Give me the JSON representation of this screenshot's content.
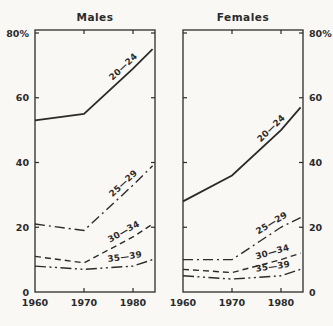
{
  "figure": {
    "background": "#f9f8f5",
    "ink": "#2b2b2b"
  },
  "chart_data": [
    {
      "type": "line",
      "title": "Males",
      "x": [
        1960,
        1970,
        1980,
        1984
      ],
      "x_ticks": [
        1970,
        1980
      ],
      "x_tick_labels": [
        {
          "year": 1960,
          "label": "1960"
        },
        {
          "year": 1970,
          "label": "1970"
        },
        {
          "year": 1980,
          "label": "1980"
        }
      ],
      "ylim": [
        0,
        81
      ],
      "y_axis_side": "left",
      "y_ticks": [
        {
          "value": 80,
          "label": "80%"
        },
        {
          "value": 60,
          "label": "60"
        },
        {
          "value": 40,
          "label": "40"
        },
        {
          "value": 20,
          "label": "20"
        },
        {
          "value": 0,
          "label": "0"
        }
      ],
      "grid": false,
      "legend": "inline-rotated-labels",
      "series": [
        {
          "name": "20—24",
          "style": "solid",
          "values": [
            53,
            55,
            69,
            75
          ]
        },
        {
          "name": "25—29",
          "style": "dash-dot",
          "values": [
            21,
            19,
            33,
            39
          ]
        },
        {
          "name": "30—34",
          "style": "dashed",
          "values": [
            11,
            9,
            17,
            21
          ]
        },
        {
          "name": "35—39",
          "style": "dash-dot-dot",
          "values": [
            8,
            7,
            8,
            10
          ]
        }
      ]
    },
    {
      "type": "line",
      "title": "Females",
      "x": [
        1960,
        1970,
        1980,
        1984
      ],
      "x_ticks": [
        1970,
        1980
      ],
      "x_tick_labels": [
        {
          "year": 1960,
          "label": "1960"
        },
        {
          "year": 1970,
          "label": "1970"
        },
        {
          "year": 1980,
          "label": "1980"
        }
      ],
      "ylim": [
        0,
        81
      ],
      "y_axis_side": "right",
      "y_ticks": [
        {
          "value": 80,
          "label": "80%"
        },
        {
          "value": 60,
          "label": "60"
        },
        {
          "value": 40,
          "label": "40"
        },
        {
          "value": 20,
          "label": "20"
        },
        {
          "value": 0,
          "label": "0"
        }
      ],
      "grid": false,
      "legend": "inline-rotated-labels",
      "series": [
        {
          "name": "20—24",
          "style": "solid",
          "values": [
            28,
            36,
            50,
            57
          ]
        },
        {
          "name": "25—29",
          "style": "dash-dot",
          "values": [
            10,
            10,
            20,
            23
          ]
        },
        {
          "name": "30—34",
          "style": "dashed",
          "values": [
            7,
            6,
            10,
            12
          ]
        },
        {
          "name": "35—39",
          "style": "dash-dot-dot",
          "values": [
            5,
            4,
            5,
            7
          ]
        }
      ]
    }
  ]
}
